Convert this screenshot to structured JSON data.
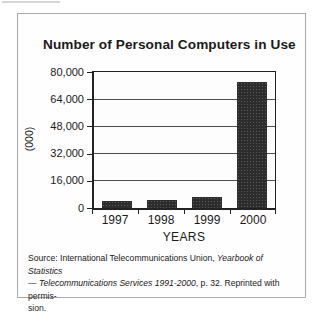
{
  "figure": {
    "title": "Number of Personal Computers in Use"
  },
  "chart_data": {
    "type": "bar",
    "title": "Number of Personal Computers in Use",
    "categories": [
      "1997",
      "1998",
      "1999",
      "2000"
    ],
    "values": [
      4000,
      5000,
      6500,
      74000
    ],
    "xlabel": "YEARS",
    "ylabel": "(000)",
    "ylim": [
      0,
      80000
    ],
    "yticks": [
      0,
      16000,
      32000,
      48000,
      64000,
      80000
    ],
    "ytick_labels": [
      "0",
      "16,000",
      "32,000",
      "48,000",
      "64,000",
      "80,000"
    ],
    "grid": true,
    "legend": false,
    "bar_color": "#2d2d2d",
    "frame_color": "#222222"
  },
  "source": {
    "lines": [
      [
        {
          "text": "Source: International Telecommunications Union, ",
          "italic": false
        },
        {
          "text": "Yearbook of Statistics",
          "italic": true
        }
      ],
      [
        {
          "text": "— Telecommunications Services 1991-2000",
          "italic": true
        },
        {
          "text": ", p. 32. Reprinted with permis-",
          "italic": false
        }
      ],
      [
        {
          "text": "sion.",
          "italic": false
        }
      ]
    ]
  }
}
